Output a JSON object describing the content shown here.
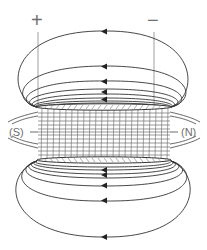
{
  "diagram": {
    "terminals": {
      "positive": "+",
      "negative": "−"
    },
    "poles": {
      "south": "(S)",
      "north": "(N)"
    },
    "field_line_direction": "right-to-left outside coil (arrows pointing left)",
    "arrows_top_count": 5,
    "arrows_bottom_count": 6,
    "colors": {
      "line": "#333333",
      "label": "#6e6e6e",
      "coil": "#555555",
      "background": "#ffffff"
    }
  }
}
